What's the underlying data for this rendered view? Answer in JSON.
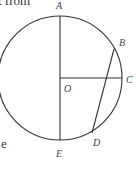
{
  "text_fragments": {
    "top_left": "t from",
    "bottom_left": "e"
  },
  "diagram": {
    "type": "circle-geometry",
    "circle": {
      "center": [
        60,
        78
      ],
      "radius": 62
    },
    "points": {
      "A": {
        "label": "A",
        "x": 60,
        "y": 16,
        "lx": 59,
        "ly": 8
      },
      "B": {
        "label": "B",
        "x": 114,
        "y": 49,
        "lx": 121,
        "ly": 44
      },
      "C": {
        "label": "C",
        "x": 122,
        "y": 78,
        "lx": 127,
        "ly": 82
      },
      "O": {
        "label": "O",
        "x": 60,
        "y": 78,
        "lx": 65,
        "ly": 91
      },
      "D": {
        "label": "D",
        "x": 92,
        "y": 133,
        "lx": 94,
        "ly": 145
      },
      "E": {
        "label": "E",
        "x": 60,
        "y": 140,
        "lx": 57,
        "ly": 156
      }
    },
    "segments": [
      [
        "A",
        "E"
      ],
      [
        "O",
        "C"
      ],
      [
        "B",
        "D"
      ]
    ],
    "stroke_color": "#333333"
  }
}
